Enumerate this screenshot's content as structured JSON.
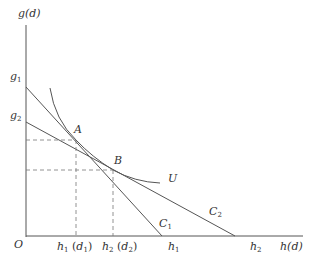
{
  "diagram": {
    "type": "indifference-curve / budget-constraint diagram",
    "y_axis_label": "g(d)",
    "x_axis_label": "h(d)",
    "origin_label": "O",
    "y_intercepts": [
      {
        "base": "g",
        "sub": "1"
      },
      {
        "base": "g",
        "sub": "2"
      }
    ],
    "x_intercepts": [
      {
        "base": "h",
        "sub": "1"
      },
      {
        "base": "h",
        "sub": "2"
      }
    ],
    "x_projection_labels": [
      {
        "text": "h",
        "sub": "1",
        "paren": "d",
        "paren_sub": "1"
      },
      {
        "text": "h",
        "sub": "2",
        "paren": "d",
        "paren_sub": "2"
      }
    ],
    "lines": [
      {
        "name": "C1",
        "base": "C",
        "sub": "1",
        "from": "g1",
        "to": "h1"
      },
      {
        "name": "C2",
        "base": "C",
        "sub": "2",
        "from": "g2",
        "to": "h2"
      }
    ],
    "curve": {
      "name": "U"
    },
    "points": [
      {
        "name": "A"
      },
      {
        "name": "B"
      }
    ],
    "colors": {
      "line": "#555555",
      "dash": "#777777",
      "text": "#333333",
      "background": "#ffffff"
    }
  }
}
